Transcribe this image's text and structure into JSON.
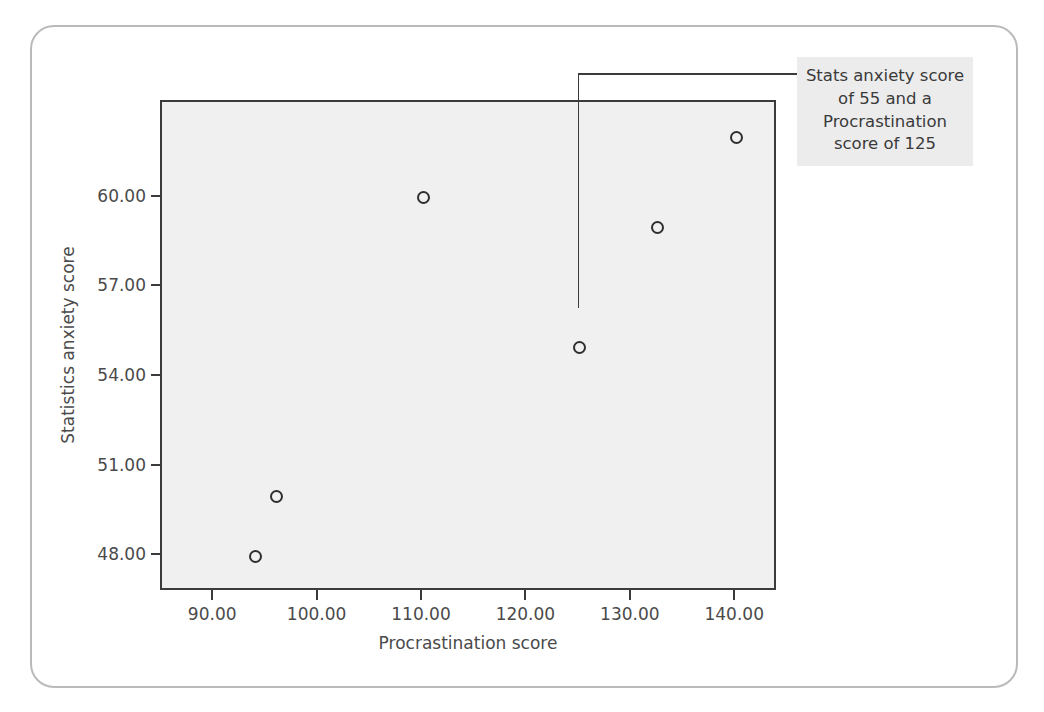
{
  "figure": {
    "background_color": "#ffffff",
    "card_border_color": "#b9babb",
    "plot_background_color": "#f0f0f0",
    "axis_color": "#3b3b3b",
    "marker_color": "#2f2f2f",
    "annotation_background_color": "#ececed",
    "text_color": "#4a4a4a"
  },
  "annotation": {
    "text": "Stats anxiety score of 55 and a Procrastination score of 125",
    "line1": "Stats anxiety score",
    "line2": "of 55 and a",
    "line3": "Procrastination",
    "line4": "score of 125",
    "target_x": 125,
    "target_y": 55
  },
  "chart_data": {
    "type": "scatter",
    "title": "",
    "xlabel": "Procrastination score",
    "ylabel": "Statistics anxiety score",
    "xlim": [
      85,
      144
    ],
    "ylim": [
      46.8,
      63.2
    ],
    "grid": false,
    "legend": false,
    "xticks": [
      90,
      100,
      110,
      120,
      130,
      140
    ],
    "xtick_labels": [
      "90.00",
      "100.00",
      "110.00",
      "120.00",
      "130.00",
      "140.00"
    ],
    "yticks": [
      48,
      51,
      54,
      57,
      60
    ],
    "ytick_labels": [
      "48.00",
      "51.00",
      "54.00",
      "57.00",
      "60.00"
    ],
    "marker": "open-circle",
    "points": [
      {
        "x": 94,
        "y": 48.0,
        "label": "point-1"
      },
      {
        "x": 96,
        "y": 50.0,
        "label": "point-2"
      },
      {
        "x": 110,
        "y": 60.0,
        "label": "point-3"
      },
      {
        "x": 125,
        "y": 55.0,
        "label": "point-4-highlighted"
      },
      {
        "x": 132.5,
        "y": 59.0,
        "label": "point-5"
      },
      {
        "x": 140,
        "y": 62.0,
        "label": "point-6"
      }
    ]
  }
}
